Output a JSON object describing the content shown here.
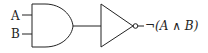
{
  "diagram": {
    "type": "logic-circuit",
    "inputs": [
      {
        "label": "A"
      },
      {
        "label": "B"
      }
    ],
    "gates": [
      {
        "type": "AND",
        "inputs": [
          "A",
          "B"
        ]
      },
      {
        "type": "NOT",
        "inputs": [
          "AND"
        ]
      }
    ],
    "output": {
      "label": "¬(A ∧ B)"
    },
    "colors": {
      "stroke": "#222222",
      "background": "#ffffff"
    }
  }
}
